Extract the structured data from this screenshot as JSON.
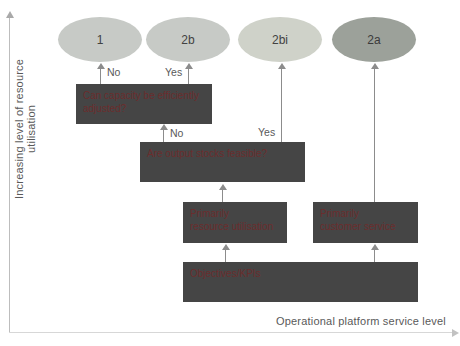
{
  "axes": {
    "y_label": "Increasing level of resource utilisation",
    "x_label": "Operational platform service level"
  },
  "ellipses": [
    {
      "label": "1"
    },
    {
      "label": "2b"
    },
    {
      "label": "2bi"
    },
    {
      "label": "2a"
    }
  ],
  "boxes": {
    "capacity": "Can capacity be efficiently\nadjusted?",
    "stocks": "Are output stocks feasible?",
    "resource": "Primarily\nresource utilisation",
    "customer": "Primarily\ncustomer service",
    "objectives": "Objectives/KPIs"
  },
  "edge_labels": {
    "capacity_no": "No",
    "capacity_yes": "Yes",
    "stocks_no": "No",
    "stocks_yes": "Yes"
  },
  "colors": {
    "box_fill": "#454545",
    "box_text": "#6b2d2d",
    "ellipse_light": "#c7cac6",
    "ellipse_lighter": "#cfd2c9",
    "ellipse_dark": "#9ca19a",
    "arrow": "#8c8c8c",
    "axis_line": "#bdbdbd",
    "label_text": "#595959"
  }
}
